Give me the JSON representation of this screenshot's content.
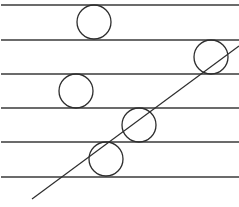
{
  "diagram": {
    "colors": {
      "background": "#ffffff",
      "stroke": "#2e2e2e"
    },
    "horizontal_line_count": 6,
    "circles": [
      {
        "id": "circle-1",
        "band": 1,
        "tangent_to_diagonal": false
      },
      {
        "id": "circle-2",
        "band": 2,
        "tangent_to_diagonal": false
      },
      {
        "id": "circle-3",
        "band": 3,
        "tangent_to_diagonal": false
      },
      {
        "id": "circle-4",
        "band": 4,
        "tangent_to_diagonal": false
      },
      {
        "id": "circle-5",
        "band": 5,
        "tangent_to_diagonal": false
      }
    ],
    "diagonal": {
      "id": "transversal-line"
    }
  }
}
